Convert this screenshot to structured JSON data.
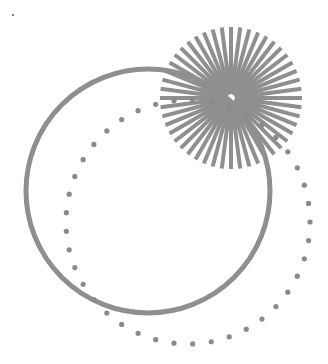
{
  "canvas": {
    "width": 328,
    "height": 364,
    "background": "#ffffff"
  },
  "shapes": {
    "solid_circle": {
      "cx": 148,
      "cy": 191,
      "r": 122,
      "stroke": "#8f8f8f",
      "stroke_width": 5
    },
    "dotted_circle": {
      "cx": 188,
      "cy": 222,
      "r": 122,
      "dot_count": 41,
      "dot_radius": 2.6,
      "fill": "#8a8a8a"
    },
    "starburst": {
      "cx": 231,
      "cy": 98,
      "inner_r": 4,
      "outer_r": 71,
      "ray_count": 48,
      "ray_width": 4,
      "stroke": "#8f8f8f"
    },
    "speck": {
      "x": 12,
      "y": 14
    }
  }
}
